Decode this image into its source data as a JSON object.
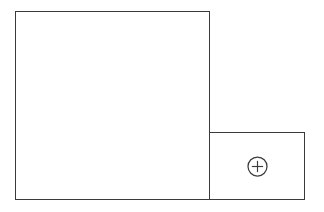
{
  "canvas": {
    "width": 324,
    "height": 212,
    "background_color": "#ffffff",
    "stroke_color": "#3b3b3b",
    "stroke_width": 1.3
  },
  "diagram": {
    "panels": [
      {
        "name": "main-panel",
        "label": "",
        "x": 15,
        "y": 11,
        "width": 195,
        "height": 189,
        "fill": "#ffffff",
        "stroke": "#3b3b3b",
        "content": ""
      },
      {
        "name": "secondary-panel",
        "label": "",
        "x": 209,
        "y": 132,
        "width": 96,
        "height": 68,
        "fill": "#ffffff",
        "stroke": "#3b3b3b",
        "content": "plus-circle-icon"
      }
    ]
  },
  "controls": {
    "add": {
      "icon": "plus-circle-icon",
      "label": "",
      "center_x": 258,
      "center_y": 166,
      "radius": 9.5,
      "color": "#3b3b3b"
    }
  },
  "a11y": {
    "main_panel_name": "Main panel",
    "secondary_panel_name": "Secondary panel",
    "add_button_name": "Add"
  }
}
